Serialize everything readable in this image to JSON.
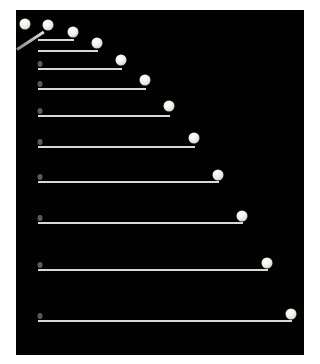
{
  "image": {
    "description": "Stroboscopic photograph of a ball projected horizontally, tracing a parabolic trajectory on a black background, with horizontal reference lines marking vertical drop at each flash interval",
    "background_color": "#020202",
    "ball_color": "#f0f0ea",
    "line_color": "#d8d8d8"
  },
  "balls": [
    {
      "x": 25,
      "y": 24
    },
    {
      "x": 48,
      "y": 25
    },
    {
      "x": 73,
      "y": 32
    },
    {
      "x": 97,
      "y": 43
    },
    {
      "x": 121,
      "y": 60
    },
    {
      "x": 145,
      "y": 80
    },
    {
      "x": 169,
      "y": 106
    },
    {
      "x": 194,
      "y": 138
    },
    {
      "x": 218,
      "y": 175
    },
    {
      "x": 242,
      "y": 216
    },
    {
      "x": 267,
      "y": 263
    },
    {
      "x": 291,
      "y": 314
    }
  ],
  "lines": [
    {
      "x1": 38,
      "x2": 74,
      "y": 39
    },
    {
      "x1": 38,
      "x2": 98,
      "y": 50
    },
    {
      "x1": 38,
      "x2": 122,
      "y": 68
    },
    {
      "x1": 38,
      "x2": 146,
      "y": 88
    },
    {
      "x1": 38,
      "x2": 170,
      "y": 115
    },
    {
      "x1": 38,
      "x2": 195,
      "y": 146
    },
    {
      "x1": 38,
      "x2": 219,
      "y": 181
    },
    {
      "x1": 38,
      "x2": 243,
      "y": 222
    },
    {
      "x1": 38,
      "x2": 268,
      "y": 269
    },
    {
      "x1": 38,
      "x2": 292,
      "y": 320
    }
  ]
}
